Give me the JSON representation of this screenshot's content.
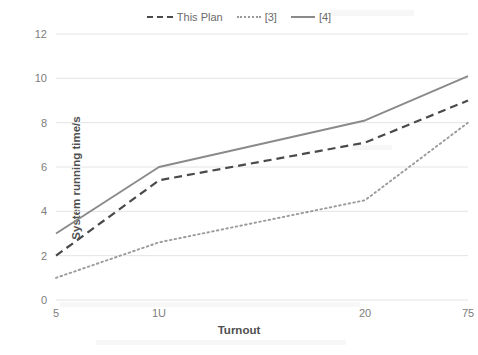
{
  "chart_data": {
    "type": "line",
    "title": "",
    "xlabel": "Turnout",
    "ylabel": "System running time/s",
    "x": [
      5,
      10,
      20,
      25
    ],
    "xtick_labels": [
      "5",
      "1U",
      "20",
      "75"
    ],
    "ytick_labels": [
      "0",
      "2",
      "4",
      "6",
      "8",
      "10",
      "12"
    ],
    "yticks": [
      0,
      2,
      4,
      6,
      8,
      10,
      12
    ],
    "ylim": [
      0,
      12
    ],
    "xlim": [
      5,
      25
    ],
    "grid": "horizontal",
    "legend_position": "top-center",
    "series": [
      {
        "name": "This Plan",
        "style": "dashed",
        "color": "#4a4a4a",
        "values": [
          2.0,
          5.4,
          7.1,
          9.0
        ]
      },
      {
        "name": "[3]",
        "style": "dotted",
        "color": "#9a9a9a",
        "values": [
          1.0,
          2.6,
          4.5,
          8.0
        ]
      },
      {
        "name": "[4]",
        "style": "solid",
        "color": "#8a8a8a",
        "values": [
          3.0,
          6.0,
          8.1,
          10.1
        ]
      }
    ]
  },
  "legend": {
    "entries": [
      {
        "label": "This Plan",
        "swatch": "dashed-line-swatch"
      },
      {
        "label": "[3]",
        "swatch": "dotted-line-swatch"
      },
      {
        "label": "[4]",
        "swatch": "solid-line-swatch"
      }
    ]
  },
  "axes": {
    "y_title": "System running time/s",
    "x_title": "Turnout",
    "y_ticks": [
      "12",
      "10",
      "8",
      "6",
      "4",
      "2",
      "0"
    ],
    "x_ticks": [
      "5",
      "1U",
      "20",
      "75"
    ]
  }
}
